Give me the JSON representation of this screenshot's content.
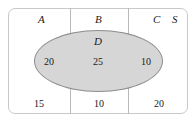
{
  "figure": {
    "type": "venn-diagram",
    "colors": {
      "ellipse_fill": "#d6d6d6",
      "ellipse_stroke": "#8d8d8d",
      "box_stroke": "#c9c9c9",
      "divider_stroke": "#b9b9b9",
      "text": "#1a1a1a"
    }
  },
  "set_labels": {
    "a": "A",
    "b": "B",
    "c": "C",
    "universe": "S",
    "ellipse": "D"
  },
  "region_values": {
    "a_and_d": "20",
    "b_and_d": "25",
    "c_and_d": "10",
    "a_not_d": "15",
    "b_not_d": "10",
    "c_not_d": "20"
  },
  "chart_data": {
    "type": "table",
    "title": "",
    "categories": [
      "A",
      "B",
      "C"
    ],
    "series": [
      {
        "name": "D",
        "values": [
          20,
          25,
          10
        ]
      },
      {
        "name": "not D",
        "values": [
          15,
          10,
          20
        ]
      }
    ],
    "annotations": [
      "A",
      "B",
      "C",
      "S",
      "D"
    ]
  }
}
